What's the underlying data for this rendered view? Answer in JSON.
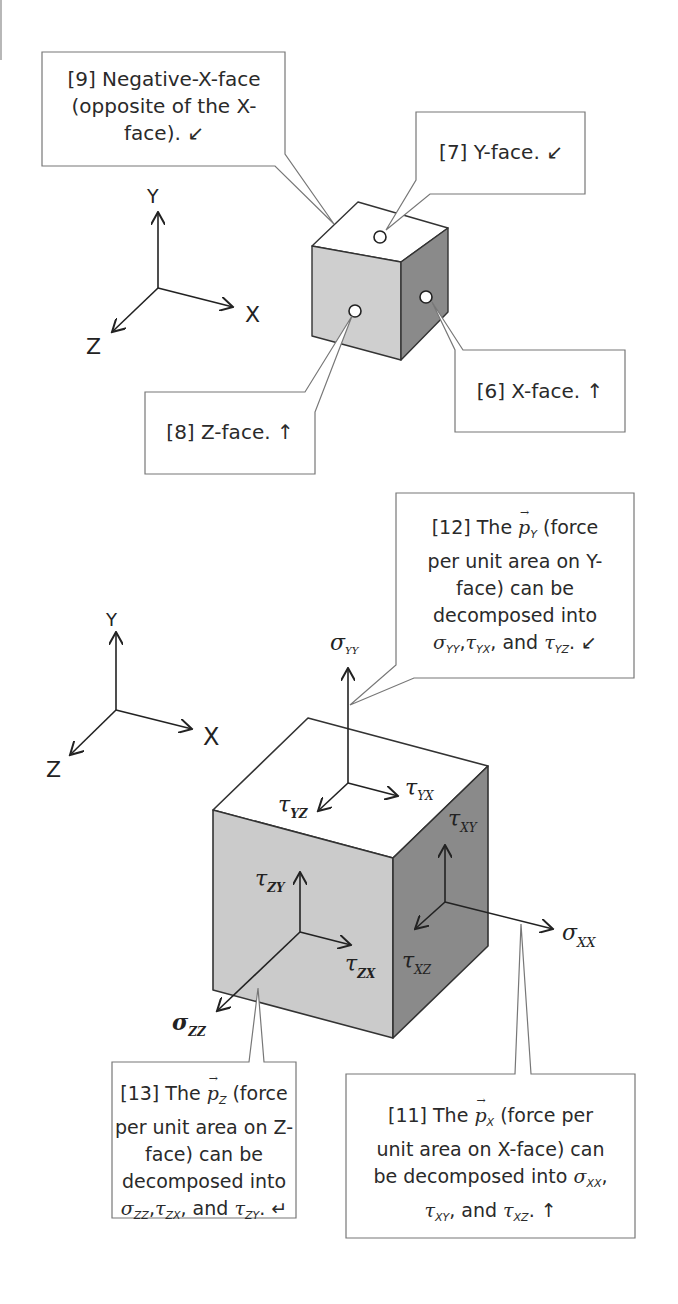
{
  "figure_top": {
    "axes": {
      "x": "X",
      "y": "Y",
      "z": "Z"
    },
    "callouts": [
      {
        "id": "9",
        "lines": [
          "[9] Negative-X-face",
          "(opposite of the X-",
          "face). ↙"
        ]
      },
      {
        "id": "7",
        "lines": [
          "[7] Y-face. ↙"
        ]
      },
      {
        "id": "6",
        "lines": [
          "[6] X-face. ↑"
        ]
      },
      {
        "id": "8",
        "lines": [
          "[8] Z-face. ↑"
        ]
      }
    ],
    "colors": {
      "top_face": "#ffffff",
      "front_face": "#cfcfcf",
      "right_face": "#8a8a8a",
      "edge": "#333333"
    }
  },
  "figure_bottom": {
    "axes": {
      "x": "X",
      "y": "Y",
      "z": "Z"
    },
    "stress_labels": {
      "sigma_yy": "σ",
      "sigma_yy_sub": "YY",
      "tau_yx": "τ",
      "tau_yx_sub": "YX",
      "tau_yz": "τ",
      "tau_yz_sub": "YZ",
      "tau_xy": "τ",
      "tau_xy_sub": "XY",
      "tau_xz": "τ",
      "tau_xz_sub": "XZ",
      "sigma_xx": "σ",
      "sigma_xx_sub": "XX",
      "tau_zy": "τ",
      "tau_zy_sub": "ZY",
      "tau_zx": "τ",
      "tau_zx_sub": "ZX",
      "sigma_zz": "σ",
      "sigma_zz_sub": "ZZ"
    },
    "callouts": {
      "c12": {
        "l1a": "[12] The ",
        "vec": "p",
        "vec_sub": "Y",
        "l1b": " (force",
        "l2": "per unit area on Y-",
        "l3": "face) can be",
        "l4": "decomposed into",
        "s1": "σ",
        "s1_sub": "YY",
        "s2": "τ",
        "s2_sub": "YX",
        "and": ", and ",
        "s3": "τ",
        "s3_sub": "YZ",
        "end": ". ↙"
      },
      "c13": {
        "l1a": "[13] The ",
        "vec": "p",
        "vec_sub": "Z",
        "l1b": " (force",
        "l2": "per unit area on Z-",
        "l3": "face) can be",
        "l4": "decomposed into",
        "s1": "σ",
        "s1_sub": "ZZ",
        "s2": "τ",
        "s2_sub": "ZX",
        "and": ", and ",
        "s3": "τ",
        "s3_sub": "ZY",
        "end": ". ↵"
      },
      "c11": {
        "l1a": "[11] The ",
        "vec": "p",
        "vec_sub": "X",
        "l1b": " (force per",
        "l2": "unit area on X-face) can",
        "l3a": "be decomposed into ",
        "s1": "σ",
        "s1_sub": "XX",
        "l3b": ",",
        "s2": "τ",
        "s2_sub": "XY",
        "and": ", and ",
        "s3": "τ",
        "s3_sub": "XZ",
        "end": ". ↑"
      }
    }
  }
}
